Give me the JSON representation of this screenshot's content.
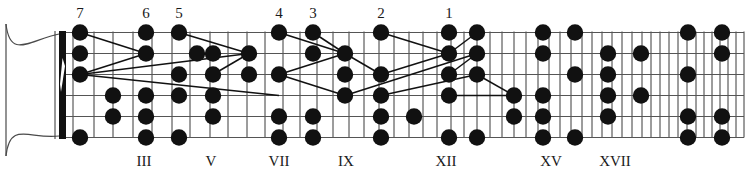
{
  "diagram": {
    "type": "fretboard",
    "instrument": "guitar",
    "strings_count": 6,
    "colors": {
      "ink": "#111111",
      "grid": "#3a3a3a",
      "string": "#555555",
      "background": "#ffffff"
    },
    "geometry": {
      "board_left": 60,
      "board_right": 744,
      "board_top": 32,
      "board_bottom": 137,
      "nut_x": 59,
      "nut_width": 7,
      "dot_radius": 8.2
    },
    "fret_x": [
      60,
      73,
      94,
      113,
      133,
      152,
      172,
      190,
      210,
      228,
      247,
      265,
      283,
      300,
      317,
      333,
      349,
      364,
      379,
      394,
      409,
      423,
      437,
      451,
      464,
      477,
      490,
      502,
      514,
      526,
      538,
      549,
      560,
      571,
      582,
      592,
      602,
      612,
      622,
      632,
      642,
      651,
      660,
      669,
      678,
      687,
      696,
      704,
      712,
      720,
      728,
      736,
      744
    ],
    "string_y": [
      32.5,
      53.5,
      74.5,
      95.5,
      116.5,
      137.5
    ]
  },
  "finger_labels": [
    {
      "text": "7",
      "x": 80,
      "y": 18
    },
    {
      "text": "6",
      "x": 146,
      "y": 18
    },
    {
      "text": "5",
      "x": 179,
      "y": 18
    },
    {
      "text": "4",
      "x": 279,
      "y": 18
    },
    {
      "text": "3",
      "x": 313,
      "y": 18
    },
    {
      "text": "2",
      "x": 381,
      "y": 18
    },
    {
      "text": "1",
      "x": 449,
      "y": 18
    }
  ],
  "position_labels": [
    {
      "text": "III",
      "x": 144,
      "y": 166
    },
    {
      "text": "V",
      "x": 211,
      "y": 166
    },
    {
      "text": "VII",
      "x": 279,
      "y": 166
    },
    {
      "text": "IX",
      "x": 346,
      "y": 166
    },
    {
      "text": "XII",
      "x": 446,
      "y": 166
    },
    {
      "text": "XV",
      "x": 551,
      "y": 166
    },
    {
      "text": "XVII",
      "x": 615,
      "y": 166
    }
  ],
  "note_dots": [
    {
      "x": 80,
      "y": 32.5,
      "string": 1,
      "name": "dot-s1-f1"
    },
    {
      "x": 80,
      "y": 53.5,
      "string": 2,
      "name": "dot-s2-f1"
    },
    {
      "x": 80,
      "y": 74.5,
      "string": 3,
      "name": "dot-s3-f1"
    },
    {
      "x": 80,
      "y": 137.5,
      "string": 6,
      "name": "dot-s6-f1"
    },
    {
      "x": 113,
      "y": 95.5,
      "string": 4,
      "name": "dot-s4-f3"
    },
    {
      "x": 113,
      "y": 116.5,
      "string": 5,
      "name": "dot-s5-f3"
    },
    {
      "x": 146,
      "y": 32.5,
      "string": 1,
      "name": "dot-s1-f4"
    },
    {
      "x": 146,
      "y": 53.5,
      "string": 2,
      "name": "dot-s2-f4"
    },
    {
      "x": 146,
      "y": 95.5,
      "string": 4,
      "name": "dot-s4-f4"
    },
    {
      "x": 146,
      "y": 116.5,
      "string": 5,
      "name": "dot-s5-f4"
    },
    {
      "x": 146,
      "y": 137.5,
      "string": 6,
      "name": "dot-s6-f4"
    },
    {
      "x": 179,
      "y": 32.5,
      "string": 1,
      "name": "dot-s1-f5"
    },
    {
      "x": 179,
      "y": 74.5,
      "string": 3,
      "name": "dot-s3-f5"
    },
    {
      "x": 179,
      "y": 95.5,
      "string": 4,
      "name": "dot-s4-f5"
    },
    {
      "x": 179,
      "y": 137.5,
      "string": 6,
      "name": "dot-s6-f5"
    },
    {
      "x": 197,
      "y": 53.5,
      "string": 2,
      "name": "dot-s2-f6"
    },
    {
      "x": 213,
      "y": 53.5,
      "string": 2,
      "name": "dot-s2-f7"
    },
    {
      "x": 213,
      "y": 74.5,
      "string": 3,
      "name": "dot-s3-f7"
    },
    {
      "x": 213,
      "y": 95.5,
      "string": 4,
      "name": "dot-s4-f7"
    },
    {
      "x": 213,
      "y": 116.5,
      "string": 5,
      "name": "dot-s5-f7"
    },
    {
      "x": 249,
      "y": 53.5,
      "string": 2,
      "name": "dot-s2-f8"
    },
    {
      "x": 249,
      "y": 74.5,
      "string": 3,
      "name": "dot-s3-f8"
    },
    {
      "x": 279,
      "y": 32.5,
      "string": 1,
      "name": "dot-s1-f9"
    },
    {
      "x": 279,
      "y": 74.5,
      "string": 3,
      "name": "dot-s3-f9"
    },
    {
      "x": 279,
      "y": 116.5,
      "string": 5,
      "name": "dot-s5-f9"
    },
    {
      "x": 279,
      "y": 137.5,
      "string": 6,
      "name": "dot-s6-f9"
    },
    {
      "x": 313,
      "y": 32.5,
      "string": 1,
      "name": "dot-s1-f10"
    },
    {
      "x": 313,
      "y": 53.5,
      "string": 2,
      "name": "dot-s2-f10"
    },
    {
      "x": 313,
      "y": 116.5,
      "string": 5,
      "name": "dot-s5-f10"
    },
    {
      "x": 313,
      "y": 137.5,
      "string": 6,
      "name": "dot-s6-f10"
    },
    {
      "x": 345,
      "y": 53.5,
      "string": 2,
      "name": "dot-s2-f11"
    },
    {
      "x": 345,
      "y": 74.5,
      "string": 3,
      "name": "dot-s3-f11"
    },
    {
      "x": 345,
      "y": 95.5,
      "string": 4,
      "name": "dot-s4-f11"
    },
    {
      "x": 381,
      "y": 32.5,
      "string": 1,
      "name": "dot-s1-f12"
    },
    {
      "x": 381,
      "y": 74.5,
      "string": 3,
      "name": "dot-s3-f12"
    },
    {
      "x": 381,
      "y": 95.5,
      "string": 4,
      "name": "dot-s4-f12"
    },
    {
      "x": 381,
      "y": 116.5,
      "string": 5,
      "name": "dot-s5-f12"
    },
    {
      "x": 381,
      "y": 137.5,
      "string": 6,
      "name": "dot-s6-f12"
    },
    {
      "x": 414,
      "y": 116.5,
      "string": 5,
      "name": "dot-s5-f13"
    },
    {
      "x": 449,
      "y": 32.5,
      "string": 1,
      "name": "dot-s1-f14"
    },
    {
      "x": 449,
      "y": 53.5,
      "string": 2,
      "name": "dot-s2-f14"
    },
    {
      "x": 449,
      "y": 74.5,
      "string": 3,
      "name": "dot-s3-f14"
    },
    {
      "x": 449,
      "y": 95.5,
      "string": 4,
      "name": "dot-s4-f14"
    },
    {
      "x": 449,
      "y": 137.5,
      "string": 6,
      "name": "dot-s6-f14"
    },
    {
      "x": 477,
      "y": 32.5,
      "string": 1,
      "name": "dot-s1-f15"
    },
    {
      "x": 477,
      "y": 53.5,
      "string": 2,
      "name": "dot-s2-f15"
    },
    {
      "x": 477,
      "y": 74.5,
      "string": 3,
      "name": "dot-s3-f15"
    },
    {
      "x": 477,
      "y": 137.5,
      "string": 6,
      "name": "dot-s6-f15"
    },
    {
      "x": 514,
      "y": 95.5,
      "string": 4,
      "name": "dot-s4-f17"
    },
    {
      "x": 514,
      "y": 116.5,
      "string": 5,
      "name": "dot-s5-f17"
    },
    {
      "x": 543,
      "y": 32.5,
      "string": 1,
      "name": "dot-s1-f18"
    },
    {
      "x": 543,
      "y": 53.5,
      "string": 2,
      "name": "dot-s2-f18"
    },
    {
      "x": 543,
      "y": 95.5,
      "string": 4,
      "name": "dot-s4-f18"
    },
    {
      "x": 543,
      "y": 116.5,
      "string": 5,
      "name": "dot-s5-f18"
    },
    {
      "x": 543,
      "y": 137.5,
      "string": 6,
      "name": "dot-s6-f18"
    },
    {
      "x": 575,
      "y": 32.5,
      "string": 1,
      "name": "dot-s1-f19"
    },
    {
      "x": 575,
      "y": 74.5,
      "string": 3,
      "name": "dot-s3-f19"
    },
    {
      "x": 575,
      "y": 137.5,
      "string": 6,
      "name": "dot-s6-f19"
    },
    {
      "x": 608,
      "y": 53.5,
      "string": 2,
      "name": "dot-s2-f20"
    },
    {
      "x": 608,
      "y": 74.5,
      "string": 3,
      "name": "dot-s3-f20"
    },
    {
      "x": 608,
      "y": 95.5,
      "string": 4,
      "name": "dot-s4-f20"
    },
    {
      "x": 608,
      "y": 116.5,
      "string": 5,
      "name": "dot-s5-f20"
    },
    {
      "x": 641,
      "y": 53.5,
      "string": 2,
      "name": "dot-s2-f21"
    },
    {
      "x": 641,
      "y": 95.5,
      "string": 4,
      "name": "dot-s4-f21"
    },
    {
      "x": 688,
      "y": 32.5,
      "string": 1,
      "name": "dot-s1-f23"
    },
    {
      "x": 688,
      "y": 74.5,
      "string": 3,
      "name": "dot-s3-f23"
    },
    {
      "x": 688,
      "y": 116.5,
      "string": 5,
      "name": "dot-s5-f23"
    },
    {
      "x": 688,
      "y": 137.5,
      "string": 6,
      "name": "dot-s6-f23"
    },
    {
      "x": 722,
      "y": 32.5,
      "string": 1,
      "name": "dot-s1-f24"
    },
    {
      "x": 722,
      "y": 53.5,
      "string": 2,
      "name": "dot-s2-f24"
    },
    {
      "x": 722,
      "y": 116.5,
      "string": 5,
      "name": "dot-s5-f24"
    },
    {
      "x": 722,
      "y": 137.5,
      "string": 6,
      "name": "dot-s6-f24"
    }
  ],
  "connectors": [
    {
      "x1": 80,
      "y1": 32.5,
      "x2": 146,
      "y2": 53.5,
      "name": "link-a1"
    },
    {
      "x1": 146,
      "y1": 53.5,
      "x2": 80,
      "y2": 74.5,
      "name": "link-a2"
    },
    {
      "x1": 179,
      "y1": 32.5,
      "x2": 249,
      "y2": 53.5,
      "name": "link-b1"
    },
    {
      "x1": 249,
      "y1": 53.5,
      "x2": 213,
      "y2": 74.5,
      "name": "link-b2"
    },
    {
      "x1": 80,
      "y1": 74.5,
      "x2": 249,
      "y2": 53.5,
      "name": "link-c1"
    },
    {
      "x1": 80,
      "y1": 74.5,
      "x2": 279,
      "y2": 95.5,
      "name": "link-c2"
    },
    {
      "x1": 279,
      "y1": 32.5,
      "x2": 345,
      "y2": 53.5,
      "name": "link-d1"
    },
    {
      "x1": 345,
      "y1": 53.5,
      "x2": 279,
      "y2": 74.5,
      "name": "link-d2"
    },
    {
      "x1": 313,
      "y1": 32.5,
      "x2": 345,
      "y2": 53.5,
      "name": "link-e1"
    },
    {
      "x1": 345,
      "y1": 53.5,
      "x2": 381,
      "y2": 74.5,
      "name": "link-e2"
    },
    {
      "x1": 279,
      "y1": 74.5,
      "x2": 345,
      "y2": 95.5,
      "name": "link-f1"
    },
    {
      "x1": 381,
      "y1": 32.5,
      "x2": 449,
      "y2": 53.5,
      "name": "link-g1"
    },
    {
      "x1": 449,
      "y1": 53.5,
      "x2": 381,
      "y2": 74.5,
      "name": "link-g2"
    },
    {
      "x1": 449,
      "y1": 53.5,
      "x2": 477,
      "y2": 32.5,
      "name": "link-g3"
    },
    {
      "x1": 345,
      "y1": 95.5,
      "x2": 477,
      "y2": 53.5,
      "name": "link-h1"
    },
    {
      "x1": 449,
      "y1": 74.5,
      "x2": 477,
      "y2": 53.5,
      "name": "link-h2"
    },
    {
      "x1": 381,
      "y1": 95.5,
      "x2": 477,
      "y2": 74.5,
      "name": "link-i1"
    },
    {
      "x1": 449,
      "y1": 95.5,
      "x2": 514,
      "y2": 95.5,
      "name": "link-j1"
    },
    {
      "x1": 477,
      "y1": 74.5,
      "x2": 514,
      "y2": 95.5,
      "name": "link-j2"
    }
  ]
}
